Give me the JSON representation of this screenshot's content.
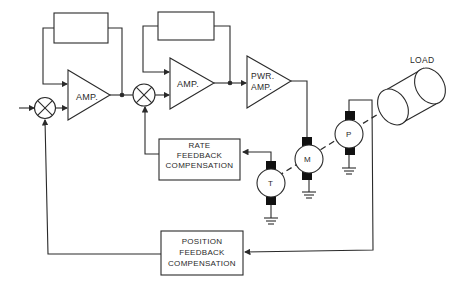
{
  "diagram": {
    "type": "servo control block diagram",
    "blocks": {
      "amp1": {
        "label": "AMP."
      },
      "amp2": {
        "label": "AMP."
      },
      "pwr_amp": {
        "line1": "PWR.",
        "line2": "AMP."
      },
      "rate_comp": {
        "line1": "RATE",
        "line2": "FEEDBACK",
        "line3": "COMPENSATION"
      },
      "position_comp": {
        "line1": "POSITION",
        "line2": "FEEDBACK",
        "line3": "COMPENSATION"
      },
      "load": {
        "label": "LOAD"
      }
    },
    "machines": {
      "tachometer": {
        "label": "T"
      },
      "motor": {
        "label": "M"
      },
      "potentiometer": {
        "label": "P"
      }
    },
    "colors": {
      "line": "#2a2a2a",
      "fill": "#ffffff",
      "brush": "#111111"
    }
  }
}
